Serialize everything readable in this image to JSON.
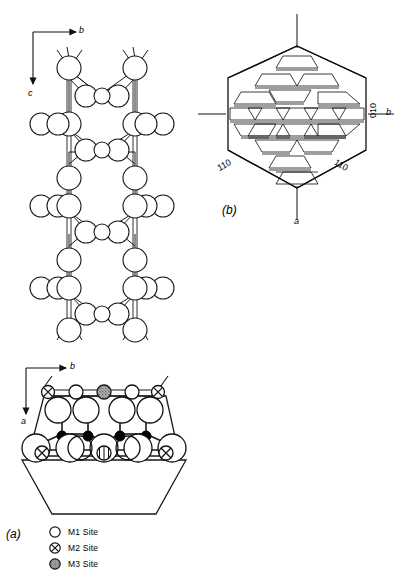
{
  "figure": {
    "panel_a": {
      "label": "(a)",
      "axes_top": {
        "horizontal": "b",
        "vertical": "c"
      },
      "axes_bottom": {
        "horizontal": "b",
        "vertical": "a"
      }
    },
    "panel_b": {
      "label": "(b)",
      "axes": {
        "horizontal": "b",
        "vertical": "a"
      },
      "face_labels": [
        {
          "index": "110",
          "position": "lower-left"
        },
        {
          "index": "110",
          "position": "lower-right"
        },
        {
          "index": "010",
          "position": "right"
        }
      ]
    },
    "legend": {
      "items": [
        {
          "symbol": "open-circle",
          "label": "M1 Site"
        },
        {
          "symbol": "crossed-circle",
          "label": "M2 Site"
        },
        {
          "symbol": "stippled-circle",
          "label": "M3 Site"
        }
      ]
    },
    "colors": {
      "stroke": "#1a1a1a",
      "fill_open": "#ffffff",
      "fill_solid": "#000000",
      "fill_stipple": "#a8a8a8",
      "background": "#ffffff"
    }
  }
}
